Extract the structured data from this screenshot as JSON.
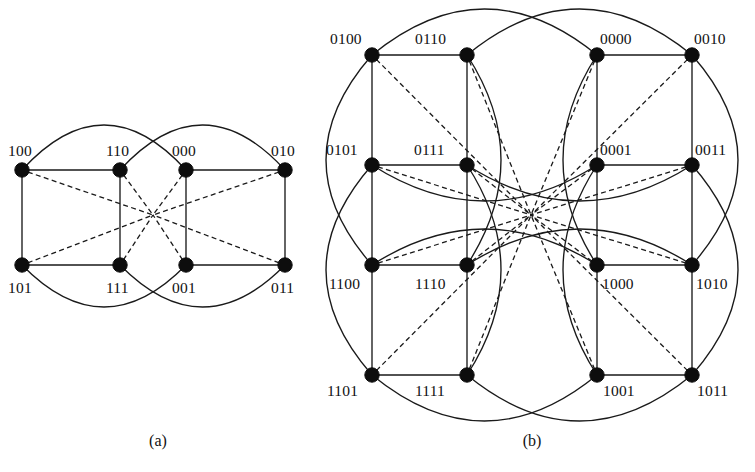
{
  "figure": {
    "width": 755,
    "height": 472,
    "background": "#ffffff",
    "ink_color": "#111111",
    "type": "graph-diagram"
  },
  "panels": [
    {
      "id": "a",
      "caption": "(a)",
      "caption_pos": {
        "x": 158,
        "y": 446
      },
      "node_count": 8,
      "label_bits": 3,
      "hub": {
        "x": 153,
        "y": 215
      },
      "nodes": [
        {
          "id": "100",
          "label": "100",
          "x": 22,
          "y": 170,
          "label_x": 8,
          "label_y": 156,
          "anchor": "start"
        },
        {
          "id": "110",
          "label": "110",
          "x": 120,
          "y": 170,
          "label_x": 106,
          "label_y": 156,
          "anchor": "start"
        },
        {
          "id": "000",
          "label": "000",
          "x": 186,
          "y": 170,
          "label_x": 172,
          "label_y": 156,
          "anchor": "start"
        },
        {
          "id": "010",
          "label": "010",
          "x": 285,
          "y": 170,
          "label_x": 271,
          "label_y": 156,
          "anchor": "start"
        },
        {
          "id": "101",
          "label": "101",
          "x": 22,
          "y": 265,
          "label_x": 8,
          "label_y": 293,
          "anchor": "start"
        },
        {
          "id": "111",
          "label": "111",
          "x": 120,
          "y": 265,
          "label_x": 106,
          "label_y": 293,
          "anchor": "start"
        },
        {
          "id": "001",
          "label": "001",
          "x": 186,
          "y": 265,
          "label_x": 172,
          "label_y": 293,
          "anchor": "start"
        },
        {
          "id": "011",
          "label": "011",
          "x": 285,
          "y": 265,
          "label_x": 271,
          "label_y": 293,
          "anchor": "start"
        }
      ],
      "solid_edges": [
        {
          "from": "100",
          "to": "110",
          "kind": "line"
        },
        {
          "from": "000",
          "to": "010",
          "kind": "line"
        },
        {
          "from": "101",
          "to": "111",
          "kind": "line"
        },
        {
          "from": "001",
          "to": "011",
          "kind": "line"
        },
        {
          "from": "100",
          "to": "101",
          "kind": "line"
        },
        {
          "from": "110",
          "to": "111",
          "kind": "line"
        },
        {
          "from": "000",
          "to": "001",
          "kind": "line"
        },
        {
          "from": "010",
          "to": "011",
          "kind": "line"
        }
      ],
      "arc_edges": [
        {
          "from": "100",
          "to": "000",
          "side": "top",
          "bulge": 45
        },
        {
          "from": "110",
          "to": "010",
          "side": "top",
          "bulge": 45
        },
        {
          "from": "101",
          "to": "001",
          "side": "bottom",
          "bulge": 42
        },
        {
          "from": "111",
          "to": "011",
          "side": "bottom",
          "bulge": 42
        }
      ],
      "dashed_edges_to_hub": [
        "100",
        "110",
        "000",
        "010",
        "101",
        "111",
        "001",
        "011"
      ]
    },
    {
      "id": "b",
      "caption": "(b)",
      "caption_pos": {
        "x": 532,
        "y": 446
      },
      "node_count": 16,
      "label_bits": 4,
      "hub": {
        "x": 531,
        "y": 215
      },
      "nodes": [
        {
          "id": "0100",
          "label": "0100",
          "x": 372,
          "y": 55,
          "label_x": 330,
          "label_y": 44,
          "anchor": "start"
        },
        {
          "id": "0110",
          "label": "0110",
          "x": 467,
          "y": 55,
          "label_x": 415,
          "label_y": 44,
          "anchor": "start"
        },
        {
          "id": "0000",
          "label": "0000",
          "x": 597,
          "y": 55,
          "label_x": 600,
          "label_y": 44,
          "anchor": "start"
        },
        {
          "id": "0010",
          "label": "0010",
          "x": 692,
          "y": 55,
          "label_x": 694,
          "label_y": 44,
          "anchor": "start"
        },
        {
          "id": "0101",
          "label": "0101",
          "x": 372,
          "y": 165,
          "label_x": 326,
          "label_y": 155,
          "anchor": "start"
        },
        {
          "id": "0111",
          "label": "0111",
          "x": 467,
          "y": 165,
          "label_x": 414,
          "label_y": 155,
          "anchor": "start"
        },
        {
          "id": "0001",
          "label": "0001",
          "x": 597,
          "y": 165,
          "label_x": 600,
          "label_y": 155,
          "anchor": "start"
        },
        {
          "id": "0011",
          "label": "0011",
          "x": 692,
          "y": 165,
          "label_x": 695,
          "label_y": 155,
          "anchor": "start"
        },
        {
          "id": "1100",
          "label": "1100",
          "x": 372,
          "y": 265,
          "label_x": 329,
          "label_y": 289,
          "anchor": "start"
        },
        {
          "id": "1110",
          "label": "1110",
          "x": 467,
          "y": 265,
          "label_x": 415,
          "label_y": 289,
          "anchor": "start"
        },
        {
          "id": "1000",
          "label": "1000",
          "x": 597,
          "y": 265,
          "label_x": 602,
          "label_y": 289,
          "anchor": "start"
        },
        {
          "id": "1010",
          "label": "1010",
          "x": 692,
          "y": 265,
          "label_x": 696,
          "label_y": 289,
          "anchor": "start"
        },
        {
          "id": "1101",
          "label": "1101",
          "x": 372,
          "y": 375,
          "label_x": 327,
          "label_y": 396,
          "anchor": "start"
        },
        {
          "id": "1111",
          "label": "1111",
          "x": 467,
          "y": 375,
          "label_x": 415,
          "label_y": 396,
          "anchor": "start"
        },
        {
          "id": "1001",
          "label": "1001",
          "x": 597,
          "y": 375,
          "label_x": 603,
          "label_y": 396,
          "anchor": "start"
        },
        {
          "id": "1011",
          "label": "1011",
          "x": 692,
          "y": 375,
          "label_x": 697,
          "label_y": 396,
          "anchor": "start"
        }
      ],
      "solid_edges": [
        {
          "from": "0100",
          "to": "0110",
          "kind": "line"
        },
        {
          "from": "0000",
          "to": "0010",
          "kind": "line"
        },
        {
          "from": "0101",
          "to": "0111",
          "kind": "line"
        },
        {
          "from": "0001",
          "to": "0011",
          "kind": "line"
        },
        {
          "from": "1100",
          "to": "1110",
          "kind": "line"
        },
        {
          "from": "1000",
          "to": "1010",
          "kind": "line"
        },
        {
          "from": "1101",
          "to": "1111",
          "kind": "line"
        },
        {
          "from": "1001",
          "to": "1011",
          "kind": "line"
        },
        {
          "from": "0100",
          "to": "0101",
          "kind": "line"
        },
        {
          "from": "0110",
          "to": "0111",
          "kind": "line"
        },
        {
          "from": "0000",
          "to": "0001",
          "kind": "line"
        },
        {
          "from": "0010",
          "to": "0011",
          "kind": "line"
        },
        {
          "from": "0101",
          "to": "1100",
          "kind": "line"
        },
        {
          "from": "0111",
          "to": "1110",
          "kind": "line"
        },
        {
          "from": "0001",
          "to": "1000",
          "kind": "line"
        },
        {
          "from": "0011",
          "to": "1010",
          "kind": "line"
        },
        {
          "from": "1100",
          "to": "1101",
          "kind": "line"
        },
        {
          "from": "1110",
          "to": "1111",
          "kind": "line"
        },
        {
          "from": "1000",
          "to": "1001",
          "kind": "line"
        },
        {
          "from": "1010",
          "to": "1011",
          "kind": "line"
        }
      ],
      "arc_edges": [
        {
          "from": "0100",
          "to": "0000",
          "side": "top",
          "bulge": 46
        },
        {
          "from": "0110",
          "to": "0010",
          "side": "top",
          "bulge": 46
        },
        {
          "from": "1101",
          "to": "1001",
          "side": "bottom",
          "bulge": 46
        },
        {
          "from": "1111",
          "to": "1011",
          "side": "bottom",
          "bulge": 46
        },
        {
          "from": "0100",
          "to": "1100",
          "side": "left",
          "bulge": 46
        },
        {
          "from": "0101",
          "to": "1101",
          "side": "left",
          "bulge": 46
        },
        {
          "from": "0010",
          "to": "1010",
          "side": "right",
          "bulge": 46
        },
        {
          "from": "0011",
          "to": "1011",
          "side": "right",
          "bulge": 46
        },
        {
          "from": "0110",
          "to": "1110",
          "side": "inner-v",
          "bulge": 34
        },
        {
          "from": "0111",
          "to": "1111",
          "side": "inner-v",
          "bulge": 34
        },
        {
          "from": "0000",
          "to": "1000",
          "side": "inner-v",
          "bulge": -34
        },
        {
          "from": "0001",
          "to": "1001",
          "side": "inner-v",
          "bulge": -34
        },
        {
          "from": "0101",
          "to": "0001",
          "side": "inner-h",
          "bulge": 36
        },
        {
          "from": "0111",
          "to": "0011",
          "side": "inner-h",
          "bulge": 36
        },
        {
          "from": "1100",
          "to": "1000",
          "side": "inner-h",
          "bulge": -36
        },
        {
          "from": "1110",
          "to": "1010",
          "side": "inner-h",
          "bulge": -36
        }
      ],
      "dashed_edges_to_hub": [
        "0100",
        "0110",
        "0000",
        "0010",
        "0101",
        "0111",
        "0001",
        "0011",
        "1100",
        "1110",
        "1000",
        "1010",
        "1101",
        "1111",
        "1001",
        "1011"
      ]
    }
  ],
  "style": {
    "node_radius": 7.2,
    "solid_stroke_width": 1.35,
    "dashed_stroke_width": 1.3,
    "dash_pattern": "5 3.4"
  }
}
